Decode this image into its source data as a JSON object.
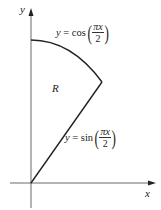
{
  "diagram": {
    "axes": {
      "x_label": "x",
      "y_label": "y"
    },
    "region_label": "R",
    "curves": [
      {
        "name": "cos-curve",
        "lhs": "y",
        "eq": "=",
        "func": "cos",
        "numerator": "πx",
        "denominator": "2"
      },
      {
        "name": "sin-curve",
        "lhs": "y",
        "eq": "=",
        "func": "sin",
        "numerator": "πx",
        "denominator": "2"
      }
    ],
    "colors": {
      "curve": "#222222",
      "axis": "#444444"
    }
  }
}
